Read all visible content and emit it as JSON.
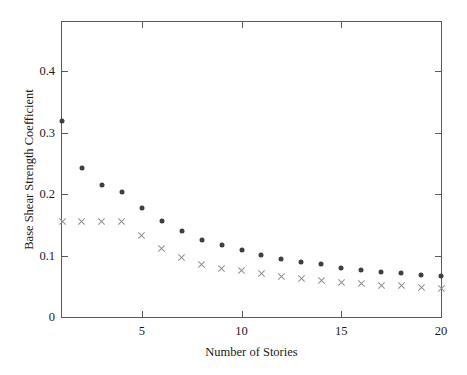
{
  "chart_data": {
    "type": "scatter",
    "title": "",
    "xlabel": "Number of Stories",
    "ylabel": "Base Shear Strength Coefficient",
    "xlim": [
      1,
      20
    ],
    "ylim": [
      0,
      0.48
    ],
    "grid": false,
    "legend": "none",
    "x_ticks": [
      5,
      10,
      15,
      20
    ],
    "x_tick_labels": [
      "5",
      "10",
      "15",
      "20"
    ],
    "y_ticks": [
      0,
      0.1,
      0.2,
      0.3,
      0.4
    ],
    "y_tick_labels": [
      "0",
      "0.1",
      "0.2",
      "0.3",
      "0.4"
    ],
    "x": [
      1,
      2,
      3,
      4,
      5,
      6,
      7,
      8,
      9,
      10,
      11,
      12,
      13,
      14,
      15,
      16,
      17,
      18,
      19,
      20
    ],
    "series": [
      {
        "name": "filled-circle-series",
        "marker": "circle",
        "color": "#3f3f3f",
        "values": [
          0.319,
          0.243,
          0.215,
          0.203,
          0.178,
          0.157,
          0.14,
          0.125,
          0.117,
          0.109,
          0.101,
          0.095,
          0.089,
          0.086,
          0.08,
          0.076,
          0.073,
          0.071,
          0.069,
          0.066
        ]
      },
      {
        "name": "cross-series",
        "marker": "cross",
        "color": "#8f8f8f",
        "values": [
          0.155,
          0.155,
          0.155,
          0.155,
          0.133,
          0.111,
          0.097,
          0.085,
          0.079,
          0.076,
          0.071,
          0.066,
          0.063,
          0.06,
          0.056,
          0.055,
          0.052,
          0.051,
          0.048,
          0.046
        ]
      }
    ]
  },
  "axes": {
    "frame_color": "#5a5a5a"
  }
}
